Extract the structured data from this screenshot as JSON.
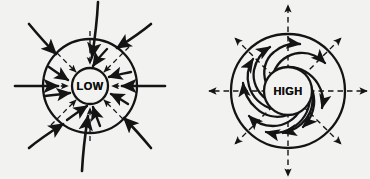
{
  "figure": {
    "background_color": "#f2f2f0",
    "ink_color": "#141414",
    "width": 370,
    "height": 179,
    "caption": ""
  },
  "diagrams": [
    {
      "id": "low-pressure",
      "label": "LOW",
      "role": "Cyclone / low pressure surface convergence",
      "center": {
        "x": 90,
        "y": 86
      },
      "outer_radius": 47,
      "inner_radius": 18,
      "rotation_sense": "counterclockwise",
      "flow_direction": "inward",
      "solid_arrow_count": 8,
      "dashed_arrow_count": 8,
      "dashed_meaning": "pressure gradient force directed inward toward the low",
      "solid_meaning": "actual surface wind spiralling inward counterclockwise",
      "solid_arrows": [
        {
          "angle_deg": 90,
          "label": "north"
        },
        {
          "angle_deg": 45,
          "label": "northeast"
        },
        {
          "angle_deg": 0,
          "label": "east"
        },
        {
          "angle_deg": 315,
          "label": "southeast"
        },
        {
          "angle_deg": 270,
          "label": "south"
        },
        {
          "angle_deg": 225,
          "label": "southwest"
        },
        {
          "angle_deg": 180,
          "label": "west"
        },
        {
          "angle_deg": 135,
          "label": "northwest"
        }
      ]
    },
    {
      "id": "high-pressure",
      "label": "HIGH",
      "role": "Anticyclone / high pressure surface divergence",
      "center": {
        "x": 288,
        "y": 91
      },
      "outer_radius": 57,
      "inner_radius": 24,
      "rotation_sense": "clockwise",
      "flow_direction": "outward",
      "solid_arrow_count": 10,
      "dashed_arrow_count": 8,
      "dashed_meaning": "pressure gradient force directed outward away from the high",
      "solid_meaning": "actual surface wind spiralling outward clockwise",
      "dashed_arrows": [
        {
          "angle_deg": 90,
          "label": "north"
        },
        {
          "angle_deg": 45,
          "label": "northeast"
        },
        {
          "angle_deg": 0,
          "label": "east"
        },
        {
          "angle_deg": 315,
          "label": "southeast"
        },
        {
          "angle_deg": 270,
          "label": "south"
        },
        {
          "angle_deg": 225,
          "label": "southwest"
        },
        {
          "angle_deg": 180,
          "label": "west"
        },
        {
          "angle_deg": 135,
          "label": "northwest"
        }
      ]
    }
  ]
}
